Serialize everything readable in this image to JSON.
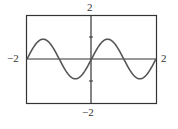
{
  "chart_data": {
    "type": "line",
    "title": "",
    "xlabel": "",
    "ylabel": "",
    "xlim": [
      -2,
      2
    ],
    "ylim": [
      -2,
      2
    ],
    "grid": false,
    "legend": null,
    "tick_labels": {
      "x_min": "−2",
      "x_max": "2",
      "y_min": "−2",
      "y_max": "2"
    },
    "y_axis_ticks": [
      -1,
      1
    ],
    "series": [
      {
        "name": "y = sin(πx)",
        "x": [
          -2,
          -1.5,
          -1,
          -0.5,
          0,
          0.5,
          1,
          1.5,
          2
        ],
        "y": [
          0,
          0.9,
          0,
          -0.9,
          0,
          0.9,
          0,
          -0.9,
          0
        ]
      }
    ],
    "colors": {
      "curve": "#555555",
      "axes": "#333333",
      "frame": "#333333"
    }
  }
}
